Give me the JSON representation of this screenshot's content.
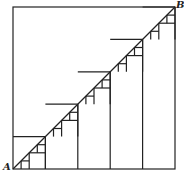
{
  "diagram": {
    "type": "staircase-approximation-of-diagonal",
    "labels": {
      "start": "A",
      "end": "B"
    },
    "square": {
      "x": 13,
      "y": 7,
      "size": 162
    },
    "steps": 5,
    "subdivision_levels": 3,
    "stroke_color": "#222222"
  }
}
